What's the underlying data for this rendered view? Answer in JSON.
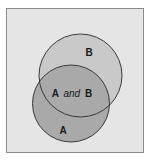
{
  "diagram": {
    "type": "venn",
    "frame": {
      "x": 6,
      "y": 8,
      "width": 138,
      "height": 145,
      "fill": "#e5e5e5",
      "stroke": "#8a8a8a"
    },
    "sets": [
      {
        "id": "B",
        "label": "B",
        "cx": 80.5,
        "cy": 75.5,
        "r": 41.5,
        "fill": "#c9c9c9",
        "label_x": 89,
        "label_y": 56
      },
      {
        "id": "A",
        "label": "A",
        "cx": 71,
        "cy": 103.5,
        "r": 38.5,
        "fill": "#a9a9a9",
        "label_x": 63,
        "label_y": 134
      }
    ],
    "intersection": {
      "label_left": "A",
      "label_mid": "and",
      "label_right": "B",
      "fill": "#a9a9a9",
      "label_x": 72,
      "label_y": 97
    },
    "stroke_color": "#3a3a3a"
  }
}
